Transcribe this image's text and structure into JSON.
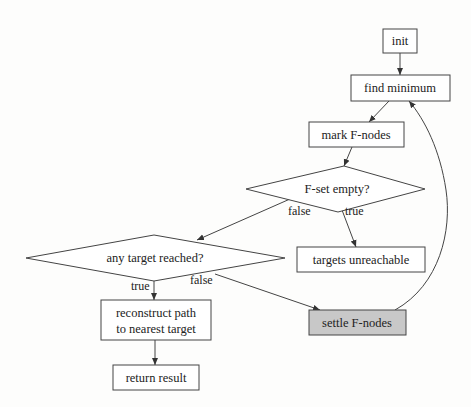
{
  "diagram": {
    "type": "flowchart",
    "nodes": {
      "init": {
        "label": "init",
        "shape": "box"
      },
      "find_min": {
        "label": "find minimum",
        "shape": "box"
      },
      "mark": {
        "label": "mark F-nodes",
        "shape": "box"
      },
      "fset": {
        "label": "F-set empty?",
        "shape": "diamond"
      },
      "unreach": {
        "label": "targets unreachable",
        "shape": "box"
      },
      "any": {
        "label": "any target reached?",
        "shape": "diamond"
      },
      "recon1": {
        "label": "reconstruct path",
        "shape": "box"
      },
      "recon2": {
        "label": "to nearest target",
        "shape": "box"
      },
      "ret": {
        "label": "return result",
        "shape": "box"
      },
      "settle": {
        "label": "settle F-nodes",
        "shape": "box",
        "fill": "#c8c8c8"
      }
    },
    "edge_labels": {
      "fset_false": "false",
      "fset_true": "true",
      "any_true": "true",
      "any_false": "false"
    },
    "edges": [
      {
        "from": "init",
        "to": "find minimum"
      },
      {
        "from": "find minimum",
        "to": "mark F-nodes"
      },
      {
        "from": "mark F-nodes",
        "to": "F-set empty?"
      },
      {
        "from": "F-set empty?",
        "to": "any target reached?",
        "label": "false"
      },
      {
        "from": "F-set empty?",
        "to": "targets unreachable",
        "label": "true"
      },
      {
        "from": "any target reached?",
        "to": "reconstruct path to nearest target",
        "label": "true"
      },
      {
        "from": "any target reached?",
        "to": "settle F-nodes",
        "label": "false"
      },
      {
        "from": "reconstruct path to nearest target",
        "to": "return result"
      },
      {
        "from": "settle F-nodes",
        "to": "find minimum"
      }
    ]
  }
}
